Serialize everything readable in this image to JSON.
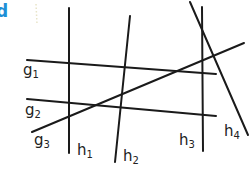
{
  "figure": {
    "corner_label": "d",
    "corner_label_color": "#1e8fd6",
    "line_color": "#1a1a1a",
    "lines": [
      {
        "id": "g1",
        "name": "g",
        "sub": "1",
        "family": "g"
      },
      {
        "id": "g2",
        "name": "g",
        "sub": "2",
        "family": "g"
      },
      {
        "id": "g3",
        "name": "g",
        "sub": "3",
        "family": "g"
      },
      {
        "id": "h1",
        "name": "h",
        "sub": "1",
        "family": "h"
      },
      {
        "id": "h2",
        "name": "h",
        "sub": "2",
        "family": "h"
      },
      {
        "id": "h3",
        "name": "h",
        "sub": "3",
        "family": "h"
      },
      {
        "id": "h4",
        "name": "h",
        "sub": "4",
        "family": "h"
      }
    ]
  }
}
